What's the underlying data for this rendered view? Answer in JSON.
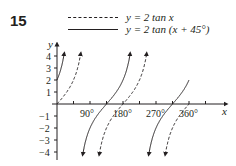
{
  "question_number": "15",
  "legend": [
    {
      "style": "dashed",
      "label": "y = 2 tan x"
    },
    {
      "style": "solid",
      "label": "y = 2 tan (x + 45°)"
    }
  ],
  "axes": {
    "x_label": "x",
    "y_label": "y",
    "x_ticks": [
      "90°",
      "180°",
      "270°",
      "360°"
    ],
    "y_ticks": [
      "4",
      "3",
      "2",
      "1",
      "−1",
      "−2",
      "−3",
      "−4"
    ]
  },
  "chart_data": {
    "type": "line",
    "title": "",
    "xlabel": "x",
    "ylabel": "y",
    "xlim": [
      0,
      360
    ],
    "ylim": [
      -4,
      4
    ],
    "x_ticks": [
      90,
      180,
      270,
      360
    ],
    "x_tick_labels": [
      "90°",
      "180°",
      "270°",
      "360°"
    ],
    "y_ticks": [
      -4,
      -3,
      -2,
      -1,
      1,
      2,
      3,
      4
    ],
    "grid": false,
    "legend_position": "top",
    "series": [
      {
        "name": "y = 2 tan x",
        "style": "dashed",
        "period": 180,
        "asymptotes": [
          90,
          270
        ],
        "zeros": [
          0,
          180,
          360
        ],
        "points": [
          [
            0,
            0
          ],
          [
            45,
            2
          ],
          [
            63.4,
            4
          ],
          [
            116.6,
            -4
          ],
          [
            135,
            -2
          ],
          [
            180,
            0
          ],
          [
            225,
            2
          ],
          [
            243.4,
            4
          ],
          [
            296.6,
            -4
          ],
          [
            315,
            -2
          ],
          [
            360,
            0
          ]
        ]
      },
      {
        "name": "y = 2 tan (x + 45°)",
        "style": "solid",
        "period": 180,
        "asymptotes": [
          45,
          225
        ],
        "zeros": [
          135,
          315
        ],
        "points": [
          [
            0,
            2
          ],
          [
            18.4,
            4
          ],
          [
            71.6,
            -4
          ],
          [
            90,
            -2
          ],
          [
            135,
            0
          ],
          [
            180,
            2
          ],
          [
            198.4,
            4
          ],
          [
            251.6,
            -4
          ],
          [
            270,
            -2
          ],
          [
            315,
            0
          ],
          [
            360,
            2
          ]
        ]
      }
    ]
  }
}
